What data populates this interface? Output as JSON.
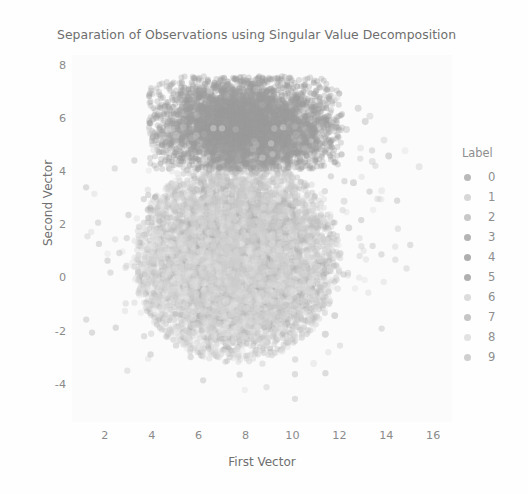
{
  "chart_data": {
    "type": "scatter",
    "title": "Separation of Observations using Singular Value Decomposition",
    "xlabel": "First Vector",
    "ylabel": "Second Vector",
    "xlim": [
      0.6,
      16.8
    ],
    "ylim": [
      -5.4,
      8.4
    ],
    "xticks": [
      2,
      4,
      6,
      8,
      10,
      12,
      14,
      16
    ],
    "yticks": [
      8,
      6,
      4,
      2,
      0,
      -2,
      -4
    ],
    "grid": false,
    "legend_position": "right",
    "legend_title": "Label",
    "series": [
      {
        "name": "0",
        "color": "#b9b9b9",
        "n_points": 980,
        "cx": 7.6,
        "cy": 0.7,
        "sx": 2.3,
        "sy": 1.9
      },
      {
        "name": "1",
        "color": "#d7d7d7",
        "n_points": 1100,
        "cx": 7.2,
        "cy": 0.2,
        "sx": 2.4,
        "sy": 1.8
      },
      {
        "name": "2",
        "color": "#c8c8c8",
        "n_points": 1000,
        "cx": 7.9,
        "cy": 1.2,
        "sx": 2.2,
        "sy": 2.0
      },
      {
        "name": "3",
        "color": "#b4b4b4",
        "n_points": 1020,
        "cx": 7.4,
        "cy": 0.5,
        "sx": 2.3,
        "sy": 1.9
      },
      {
        "name": "4",
        "color": "#aeaeae",
        "n_points": 990,
        "cx": 8.1,
        "cy": 1.0,
        "sx": 2.2,
        "sy": 1.9
      },
      {
        "name": "5",
        "color": "#b0b0b0",
        "n_points": 900,
        "cx": 7.5,
        "cy": 0.4,
        "sx": 2.3,
        "sy": 1.9
      },
      {
        "name": "6",
        "color": "#dcdcdc",
        "n_points": 980,
        "cx": 7.0,
        "cy": 0.1,
        "sx": 2.4,
        "sy": 1.8
      },
      {
        "name": "7",
        "color": "#c5c5c5",
        "n_points": 1010,
        "cx": 8.3,
        "cy": 1.6,
        "sx": 2.2,
        "sy": 2.0
      },
      {
        "name": "8",
        "color": "#e2e2e2",
        "n_points": 950,
        "cx": 7.3,
        "cy": 0.3,
        "sx": 2.3,
        "sy": 1.8
      },
      {
        "name": "9",
        "color": "#cfcfcf",
        "n_points": 970,
        "cx": 7.7,
        "cy": 0.8,
        "sx": 2.3,
        "sy": 1.9
      }
    ],
    "dense_cluster_note": "Large overlapping cloud centered near (7.5, 0.5); a darker dense band sits near y = 5 to 7 between x = 5 and x = 11.",
    "marker": {
      "shape": "circle",
      "size": 6,
      "alpha": 0.35
    }
  },
  "legend": {
    "title": "Label",
    "entries": [
      {
        "label": "0",
        "color": "#b9b9b9"
      },
      {
        "label": "1",
        "color": "#d7d7d7"
      },
      {
        "label": "2",
        "color": "#c8c8c8"
      },
      {
        "label": "3",
        "color": "#b4b4b4"
      },
      {
        "label": "4",
        "color": "#aeaeae"
      },
      {
        "label": "5",
        "color": "#b0b0b0"
      },
      {
        "label": "6",
        "color": "#dcdcdc"
      },
      {
        "label": "7",
        "color": "#c5c5c5"
      },
      {
        "label": "8",
        "color": "#e2e2e2"
      },
      {
        "label": "9",
        "color": "#cfcfcf"
      }
    ]
  },
  "colors": {
    "figure_background": "#fefefe",
    "plot_background": "#fbfbfb",
    "title_text": "#6e6e6e",
    "axis_label_text": "#6f6f6f",
    "tick_text": "#8a8a8a",
    "legend_text": "#8e8e8e"
  }
}
